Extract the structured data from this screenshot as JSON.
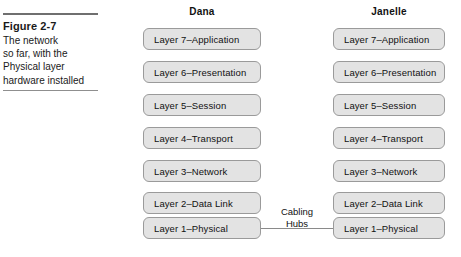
{
  "caption": {
    "figure_label": "Figure 2-7",
    "lines": [
      "The network",
      "so far, with the",
      "Physical layer",
      "hardware installed"
    ]
  },
  "columns": [
    {
      "name": "dana",
      "title": "Dana",
      "layers": [
        "Layer 7–Application",
        "Layer 6–Presentation",
        "Layer 5–Session",
        "Layer 4–Transport",
        "Layer 3–Network",
        "Layer 2–Data Link",
        "Layer 1–Physical"
      ]
    },
    {
      "name": "janelle",
      "title": "Janelle",
      "layers": [
        "Layer 7–Application",
        "Layer 6–Presentation",
        "Layer 5–Session",
        "Layer 4–Transport",
        "Layer 3–Network",
        "Layer 2–Data Link",
        "Layer 1–Physical"
      ]
    }
  ],
  "connector": {
    "label_line_1": "Cabling",
    "label_line_2": "Hubs"
  },
  "colors": {
    "box_fill": "#e3e3e3",
    "box_border": "#9a9a9a",
    "rule": "#6f6f6f",
    "text": "#111111"
  }
}
